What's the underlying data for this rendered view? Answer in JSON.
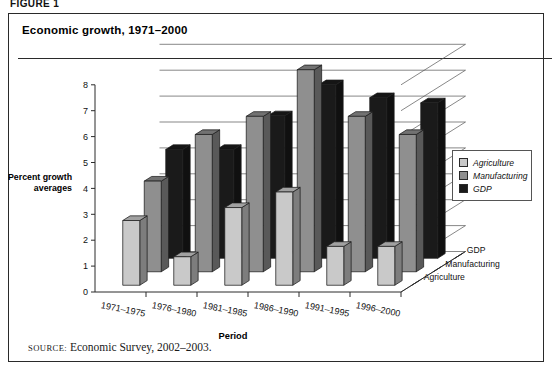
{
  "figure": {
    "label": "FIGURE 1",
    "title": "Economic growth, 1971–2000",
    "source_keyword": "source:",
    "source_text": " Economic Survey, 2002–2003."
  },
  "legend": {
    "items": [
      {
        "label": "Agriculture",
        "color": "#c9c9c9"
      },
      {
        "label": "Manufacturing",
        "color": "#8f8f8f"
      },
      {
        "label": "GDP",
        "color": "#1a1a1a"
      }
    ]
  },
  "axes": {
    "ylabel_line1": "Percent growth",
    "ylabel_line2": "averages",
    "xlabel": "Period",
    "depth_labels": [
      "Agriculture",
      "Manufacturing",
      "GDP"
    ]
  },
  "chart_data": {
    "type": "bar",
    "title": "Economic growth, 1971–2000",
    "subtitle": "",
    "xlabel": "Period",
    "ylabel": "Percent growth averages",
    "zlabel": "",
    "projection": "3d",
    "grid": true,
    "legend_position": "right",
    "ylim": [
      0,
      8
    ],
    "yticks": [
      0,
      1,
      2,
      3,
      4,
      5,
      6,
      7,
      8
    ],
    "ytick_labels": [
      "0",
      "1",
      "2",
      "3",
      "4",
      "5",
      "6",
      "7",
      "8"
    ],
    "categories": [
      "1971–1975",
      "1976–1980",
      "1981–1985",
      "1986–1990",
      "1991–1995",
      "1996–2000"
    ],
    "depth_categories": [
      "Agriculture",
      "Manufacturing",
      "GDP"
    ],
    "series": [
      {
        "name": "Agriculture",
        "color": "#c9c9c9",
        "values": [
          2.5,
          1.1,
          3.0,
          3.6,
          1.5,
          1.5
        ]
      },
      {
        "name": "Manufacturing",
        "color": "#8f8f8f",
        "values": [
          3.5,
          5.3,
          6.0,
          7.8,
          6.0,
          5.3
        ]
      },
      {
        "name": "GDP",
        "color": "#1a1a1a",
        "values": [
          4.2,
          4.2,
          5.5,
          6.7,
          6.2,
          6.0
        ]
      }
    ],
    "source": "Economic Survey, 2002–2003."
  }
}
